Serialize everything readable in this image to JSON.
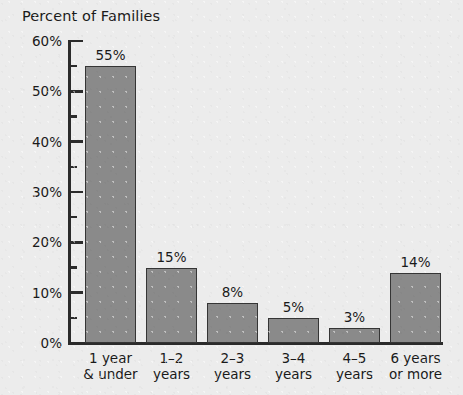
{
  "chart_data": {
    "type": "bar",
    "title": "Percent of Families",
    "xlabel": "",
    "ylabel": "Percent of Families",
    "ylim": [
      0,
      60
    ],
    "grid": false,
    "legend": false,
    "y_tick_labels": [
      "60%",
      "50%",
      "40%",
      "30%",
      "20%",
      "10%",
      "0%"
    ],
    "y_major_ticks": [
      0,
      10,
      20,
      30,
      40,
      50,
      60
    ],
    "y_minor_ticks": [
      5,
      15,
      25,
      35,
      45,
      55
    ],
    "categories": [
      "1 year & under",
      "1–2 years",
      "2–3 years",
      "3–4 years",
      "4–5 years",
      "6 years or more"
    ],
    "category_lines": [
      [
        "1 year",
        "& under"
      ],
      [
        "1–2",
        "years"
      ],
      [
        "2–3",
        "years"
      ],
      [
        "3–4",
        "years"
      ],
      [
        "4–5",
        "years"
      ],
      [
        "6 years",
        "or more"
      ]
    ],
    "values": [
      55,
      15,
      8,
      5,
      3,
      14
    ],
    "value_labels": [
      "55%",
      "15%",
      "8%",
      "5%",
      "3%",
      "14%"
    ],
    "colors": {
      "bar_fill": "#8a8a8a",
      "bar_border": "#353535",
      "axis": "#2b2b2b",
      "background": "#ececec",
      "text": "#1a1a1a"
    }
  }
}
